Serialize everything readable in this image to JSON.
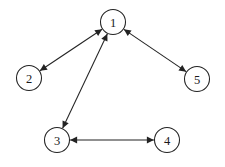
{
  "figure": {
    "background_color": "#ffffff",
    "stroke_color": "#232323",
    "label_color": "#1a1a1a",
    "width": 225,
    "height": 167
  },
  "graph": {
    "type": "node-link-diagram",
    "directed": false,
    "arrowheads": "both-ends",
    "node_radius": 12.5,
    "nodes": [
      {
        "id": "1",
        "label": "1",
        "x": 113,
        "y": 22
      },
      {
        "id": "2",
        "label": "2",
        "x": 29,
        "y": 78
      },
      {
        "id": "3",
        "label": "3",
        "x": 57,
        "y": 140
      },
      {
        "id": "4",
        "label": "4",
        "x": 167,
        "y": 140
      },
      {
        "id": "5",
        "label": "5",
        "x": 197,
        "y": 79
      }
    ],
    "edges": [
      {
        "id": "edge-1-2",
        "source": "1",
        "target": "2",
        "double_headed": true
      },
      {
        "id": "edge-1-3",
        "source": "1",
        "target": "3",
        "double_headed": true
      },
      {
        "id": "edge-1-5",
        "source": "1",
        "target": "5",
        "double_headed": true
      },
      {
        "id": "edge-3-4",
        "source": "3",
        "target": "4",
        "double_headed": true
      }
    ]
  }
}
